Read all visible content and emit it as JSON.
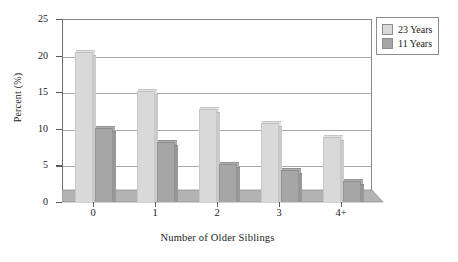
{
  "chart_data": {
    "type": "bar",
    "title": "",
    "xlabel": "Number of Older Siblings",
    "ylabel": "Percent (%)",
    "categories": [
      "0",
      "1",
      "2",
      "3",
      "4+"
    ],
    "series": [
      {
        "name": "23 Years",
        "color": "#d9d9d9",
        "values": [
          20.4,
          15.0,
          12.6,
          10.7,
          8.7
        ]
      },
      {
        "name": "11 Years",
        "color": "#a6a6a6",
        "values": [
          10.0,
          8.0,
          5.0,
          4.3,
          2.7
        ]
      }
    ],
    "ylim": [
      0,
      25
    ],
    "yticks": [
      "0",
      "5",
      "10",
      "15",
      "20",
      "25"
    ],
    "grid": true,
    "legend_position": "top-right",
    "style": "3d-columns"
  },
  "legend": {
    "entries": [
      {
        "label": "23 Years",
        "swatch": "#d9d9d9"
      },
      {
        "label": "11 Years",
        "swatch": "#a6a6a6"
      }
    ]
  },
  "colors": {
    "series_light": "#d9d9d9",
    "series_dark": "#a6a6a6",
    "floor": "#b3b3b3",
    "axis": "#6e6e6e",
    "grid": "#a9a9a9"
  }
}
